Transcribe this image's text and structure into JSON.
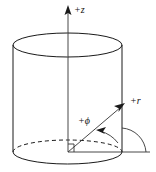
{
  "figure": {
    "background_color": "#ffffff",
    "line_color": "#1a1a1a",
    "labels": {
      "z_axis": "+z",
      "r_axis": "+r",
      "phi_angle": "+ϕ"
    },
    "elements": {
      "cylinder": "transparent-cylinder",
      "top_ellipse": "top-rim-ellipse-solid",
      "bottom_ellipse_front": "bottom-rim-front-solid",
      "bottom_ellipse_back": "bottom-rim-back-dashed",
      "vertical_axis": "z-axis-line",
      "radial_ray": "r-axis-ray",
      "reference_line": "horizontal-reference-line",
      "angle_arc": "phi-angle-arc",
      "right_angle_mark": "right-angle-marker",
      "reference_arc": "right-side-quarter-arc"
    },
    "geometry": {
      "origin_x": 68,
      "origin_y": 152,
      "cylinder_left_x": 13,
      "cylinder_right_x": 122,
      "top_ellipse_center_y": 45,
      "bottom_ellipse_center_y": 152,
      "ellipse_rx": 54,
      "ellipse_ry": 12,
      "z_arrow_tip_y": 6,
      "r_arrow_tip_x": 124,
      "r_arrow_tip_y": 104,
      "baseline_end_x": 150
    }
  }
}
